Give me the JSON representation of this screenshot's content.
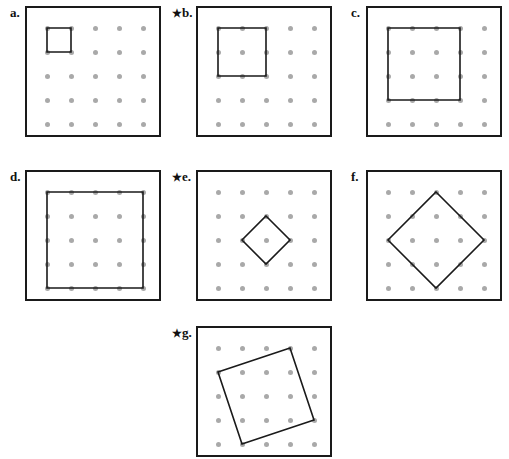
{
  "figure": {
    "title": "",
    "panel_width": 136,
    "panel_height": 131,
    "grid": {
      "rows": 5,
      "cols": 5,
      "spacing": 24,
      "margin": 20,
      "dot_color": "#a9a9a9"
    },
    "stroke_color": "#1a1a1a",
    "background": "#ffffff"
  },
  "panels": [
    {
      "id": "a",
      "label": "a.",
      "starred": false,
      "star": "",
      "x": 25,
      "y": 6,
      "label_x": 10,
      "label_y": 6,
      "shape": {
        "name": "square-1x1",
        "points": "0,0 1,0 1,1 0,1"
      }
    },
    {
      "id": "b",
      "label": "b.",
      "starred": true,
      "star": "★",
      "x": 196,
      "y": 6,
      "label_x": 172,
      "label_y": 6,
      "shape": {
        "name": "square-2x2",
        "points": "0,0 2,0 2,2 0,2"
      }
    },
    {
      "id": "c",
      "label": "c.",
      "starred": false,
      "star": "",
      "x": 366,
      "y": 6,
      "label_x": 351,
      "label_y": 6,
      "shape": {
        "name": "square-3x3",
        "points": "0,0 3,0 3,3 0,3"
      }
    },
    {
      "id": "d",
      "label": "d.",
      "starred": false,
      "star": "",
      "x": 25,
      "y": 170,
      "label_x": 10,
      "label_y": 170,
      "shape": {
        "name": "square-4x4",
        "points": "0,0 4,0 4,4 0,4"
      }
    },
    {
      "id": "e",
      "label": "e.",
      "starred": true,
      "star": "★",
      "x": 196,
      "y": 170,
      "label_x": 172,
      "label_y": 170,
      "shape": {
        "name": "diamond-tilted-1-1",
        "points": "2,1 3,2 2,3 1,2"
      }
    },
    {
      "id": "f",
      "label": "f.",
      "starred": false,
      "star": "",
      "x": 366,
      "y": 170,
      "label_x": 351,
      "label_y": 170,
      "shape": {
        "name": "diamond-tilted-2-2",
        "points": "2,0 4,2 2,4 0,2"
      }
    },
    {
      "id": "g",
      "label": "g.",
      "starred": true,
      "star": "★",
      "x": 196,
      "y": 326,
      "label_x": 172,
      "label_y": 326,
      "shape": {
        "name": "square-tilted-3-1",
        "points": "3,0 4,3 1,4 0,1"
      }
    }
  ]
}
